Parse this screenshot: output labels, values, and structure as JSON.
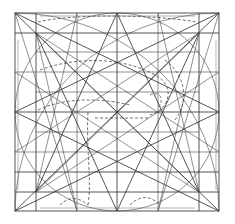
{
  "figure": {
    "background": "#ffffff",
    "ink": "#2a2a2a",
    "outer_square": {
      "x1": 15,
      "y1": 13,
      "x2": 219,
      "y2": 211
    },
    "vertical_lines": [
      36,
      77,
      117,
      158,
      199
    ],
    "horizontal_lines": [
      33,
      52,
      72,
      92,
      112,
      132,
      152,
      172,
      192
    ],
    "labels": []
  }
}
